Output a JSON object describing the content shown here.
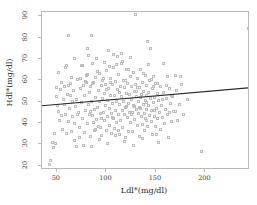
{
  "chart_data": {
    "type": "scatter",
    "title": "",
    "xlabel": "Ldl*(mg/dl)",
    "ylabel": "Hdl*(mg/dl)",
    "xlim": [
      35,
      245
    ],
    "ylim": [
      18,
      92
    ],
    "xticks": [
      50,
      100,
      150,
      200
    ],
    "xtick_labels": [
      "50",
      "100",
      "150",
      "200"
    ],
    "yticks": [
      20,
      30,
      40,
      50,
      60,
      70,
      80,
      90
    ],
    "ytick_labels": [
      "20",
      "30",
      "40",
      "50",
      "60",
      "70",
      "80",
      "90"
    ],
    "grid": false,
    "legend": null,
    "marker": "open-square",
    "marker_color": "#bdbdbd",
    "frame_color": "#b9b9b9",
    "fit_line": {
      "type": "linear-regression",
      "color": "#2a2a2a",
      "x_start": 35,
      "y_start": 47.5,
      "x_end": 245,
      "y_end": 56.0
    },
    "points": [
      [
        43,
        20.8
      ],
      [
        44,
        22.6
      ],
      [
        46,
        31.0
      ],
      [
        47,
        28.4
      ],
      [
        48,
        35.3
      ],
      [
        49,
        30.4
      ],
      [
        50,
        52.3
      ],
      [
        50,
        56.5
      ],
      [
        51,
        48.2
      ],
      [
        52,
        45.3
      ],
      [
        52,
        63.7
      ],
      [
        53,
        41.0
      ],
      [
        54,
        55.9
      ],
      [
        55,
        43.6
      ],
      [
        56,
        37.2
      ],
      [
        57,
        50.8
      ],
      [
        58,
        57.0
      ],
      [
        59,
        44.1
      ],
      [
        60,
        34.9
      ],
      [
        60,
        67.1
      ],
      [
        61,
        53.2
      ],
      [
        62,
        80.9
      ],
      [
        62,
        40.5
      ],
      [
        63,
        46.7
      ],
      [
        64,
        58.3
      ],
      [
        65,
        36.1
      ],
      [
        65,
        61.2
      ],
      [
        66,
        43.0
      ],
      [
        67,
        55.4
      ],
      [
        68,
        70.2
      ],
      [
        68,
        39.6
      ],
      [
        69,
        47.8
      ],
      [
        70,
        51.0
      ],
      [
        70,
        29.0
      ],
      [
        71,
        60.4
      ],
      [
        72,
        44.9
      ],
      [
        73,
        38.1
      ],
      [
        74,
        56.2
      ],
      [
        75,
        49.5
      ],
      [
        75,
        66.8
      ],
      [
        76,
        42.3
      ],
      [
        77,
        57.7
      ],
      [
        78,
        35.6
      ],
      [
        78,
        52.9
      ],
      [
        79,
        46.0
      ],
      [
        80,
        62.1
      ],
      [
        80,
        59.0
      ],
      [
        81,
        40.0
      ],
      [
        81,
        75.0
      ],
      [
        82,
        48.6
      ],
      [
        83,
        54.3
      ],
      [
        83,
        44.2
      ],
      [
        84,
        57.2
      ],
      [
        84,
        33.8
      ],
      [
        85,
        50.1
      ],
      [
        85,
        81.0
      ],
      [
        86,
        43.5
      ],
      [
        86,
        67.8
      ],
      [
        87,
        58.9
      ],
      [
        88,
        46.3
      ],
      [
        88,
        36.7
      ],
      [
        89,
        52.0
      ],
      [
        89,
        61.5
      ],
      [
        90,
        41.8
      ],
      [
        90,
        70.3
      ],
      [
        91,
        47.2
      ],
      [
        92,
        55.1
      ],
      [
        92,
        38.4
      ],
      [
        93,
        49.9
      ],
      [
        93,
        63.0
      ],
      [
        94,
        44.6
      ],
      [
        95,
        57.5
      ],
      [
        95,
        34.0
      ],
      [
        96,
        51.3
      ],
      [
        96,
        60.0
      ],
      [
        97,
        45.0
      ],
      [
        98,
        53.8
      ],
      [
        98,
        41.1
      ],
      [
        99,
        58.2
      ],
      [
        99,
        48.0
      ],
      [
        100,
        36.5
      ],
      [
        100,
        64.4
      ],
      [
        101,
        50.5
      ],
      [
        101,
        43.2
      ],
      [
        102,
        56.0
      ],
      [
        102,
        74.0
      ],
      [
        103,
        46.8
      ],
      [
        103,
        39.0
      ],
      [
        104,
        52.7
      ],
      [
        104,
        61.0
      ],
      [
        105,
        44.4
      ],
      [
        105,
        35.1
      ],
      [
        106,
        57.9
      ],
      [
        106,
        49.1
      ],
      [
        107,
        42.0
      ],
      [
        107,
        66.2
      ],
      [
        108,
        53.0
      ],
      [
        108,
        37.5
      ],
      [
        109,
        59.6
      ],
      [
        109,
        46.1
      ],
      [
        110,
        50.2
      ],
      [
        110,
        40.3
      ],
      [
        111,
        55.5
      ],
      [
        111,
        71.0
      ],
      [
        112,
        44.0
      ],
      [
        112,
        62.8
      ],
      [
        113,
        48.9
      ],
      [
        113,
        34.5
      ],
      [
        114,
        57.1
      ],
      [
        114,
        41.4
      ],
      [
        115,
        52.2
      ],
      [
        115,
        68.0
      ],
      [
        116,
        45.7
      ],
      [
        116,
        38.0
      ],
      [
        117,
        60.1
      ],
      [
        117,
        50.0
      ],
      [
        118,
        43.8
      ],
      [
        118,
        56.6
      ],
      [
        119,
        47.4
      ],
      [
        119,
        33.2
      ],
      [
        120,
        54.0
      ],
      [
        120,
        64.9
      ],
      [
        121,
        42.6
      ],
      [
        121,
        58.5
      ],
      [
        122,
        49.3
      ],
      [
        122,
        36.0
      ],
      [
        123,
        53.5
      ],
      [
        123,
        45.1
      ],
      [
        124,
        61.7
      ],
      [
        124,
        40.1
      ],
      [
        125,
        51.1
      ],
      [
        125,
        57.3
      ],
      [
        126,
        44.8
      ],
      [
        126,
        35.8
      ],
      [
        127,
        63.5
      ],
      [
        127,
        48.4
      ],
      [
        128,
        54.7
      ],
      [
        128,
        41.6
      ],
      [
        129,
        90.9
      ],
      [
        129,
        58.0
      ],
      [
        130,
        46.5
      ],
      [
        130,
        52.5
      ],
      [
        131,
        38.8
      ],
      [
        131,
        60.7
      ],
      [
        132,
        44.3
      ],
      [
        132,
        50.3
      ],
      [
        133,
        56.8
      ],
      [
        133,
        33.5
      ],
      [
        134,
        47.0
      ],
      [
        134,
        65.3
      ],
      [
        135,
        42.9
      ],
      [
        135,
        53.4
      ],
      [
        136,
        59.2
      ],
      [
        136,
        39.4
      ],
      [
        137,
        48.8
      ],
      [
        137,
        55.0
      ],
      [
        138,
        44.5
      ],
      [
        138,
        36.3
      ],
      [
        139,
        62.4
      ],
      [
        139,
        50.7
      ],
      [
        140,
        41.3
      ],
      [
        140,
        57.6
      ],
      [
        141,
        46.2
      ],
      [
        141,
        52.8
      ],
      [
        142,
        78.0
      ],
      [
        142,
        38.6
      ],
      [
        143,
        54.5
      ],
      [
        143,
        48.1
      ],
      [
        144,
        43.4
      ],
      [
        144,
        59.9
      ],
      [
        145,
        75.0
      ],
      [
        145,
        51.6
      ],
      [
        146,
        40.8
      ],
      [
        146,
        45.9
      ],
      [
        147,
        56.3
      ],
      [
        147,
        34.7
      ],
      [
        148,
        49.7
      ],
      [
        148,
        61.9
      ],
      [
        149,
        43.1
      ],
      [
        149,
        52.1
      ],
      [
        150,
        38.2
      ],
      [
        150,
        58.7
      ],
      [
        151,
        46.9
      ],
      [
        152,
        53.9
      ],
      [
        152,
        41.9
      ],
      [
        153,
        31.0
      ],
      [
        153,
        50.6
      ],
      [
        154,
        44.7
      ],
      [
        155,
        57.0
      ],
      [
        155,
        36.9
      ],
      [
        156,
        48.3
      ],
      [
        157,
        42.4
      ],
      [
        158,
        68.0
      ],
      [
        158,
        54.2
      ],
      [
        159,
        39.8
      ],
      [
        160,
        46.4
      ],
      [
        161,
        51.5
      ],
      [
        162,
        62.0
      ],
      [
        162,
        43.9
      ],
      [
        163,
        33.0
      ],
      [
        164,
        56.1
      ],
      [
        165,
        49.0
      ],
      [
        166,
        40.6
      ],
      [
        167,
        52.4
      ],
      [
        168,
        45.5
      ],
      [
        170,
        62.3
      ],
      [
        171,
        55.3
      ],
      [
        172,
        41.2
      ],
      [
        174,
        48.7
      ],
      [
        176,
        58.0
      ],
      [
        178,
        44.0
      ],
      [
        182,
        51.0
      ],
      [
        196,
        26.8
      ],
      [
        243,
        84.5
      ],
      [
        59,
        66.0
      ],
      [
        64,
        52.8
      ],
      [
        71,
        44.0
      ],
      [
        76,
        67.0
      ],
      [
        79,
        59.4
      ],
      [
        82,
        71.5
      ],
      [
        87,
        40.2
      ],
      [
        91,
        64.0
      ],
      [
        94,
        37.9
      ],
      [
        97,
        60.8
      ],
      [
        100,
        55.8
      ],
      [
        103,
        66.5
      ],
      [
        106,
        42.8
      ],
      [
        110,
        67.5
      ],
      [
        113,
        54.4
      ],
      [
        116,
        69.0
      ],
      [
        119,
        59.8
      ],
      [
        122,
        65.0
      ],
      [
        125,
        44.1
      ],
      [
        128,
        47.8
      ],
      [
        131,
        56.5
      ],
      [
        134,
        51.8
      ],
      [
        137,
        63.2
      ],
      [
        140,
        49.4
      ],
      [
        143,
        67.2
      ],
      [
        146,
        60.3
      ],
      [
        149,
        46.0
      ],
      [
        152,
        58.4
      ],
      [
        157,
        50.9
      ],
      [
        161,
        57.8
      ],
      [
        166,
        53.1
      ],
      [
        170,
        45.2
      ],
      [
        68,
        31.8
      ],
      [
        73,
        33.4
      ],
      [
        77,
        29.6
      ],
      [
        85,
        28.9
      ],
      [
        93,
        32.1
      ],
      [
        101,
        30.2
      ],
      [
        109,
        34.2
      ],
      [
        118,
        31.5
      ],
      [
        127,
        29.4
      ],
      [
        136,
        32.8
      ],
      [
        86,
        58.6
      ],
      [
        89,
        37.0
      ],
      [
        95,
        42.1
      ],
      [
        104,
        58.8
      ],
      [
        112,
        36.6
      ],
      [
        120,
        47.6
      ],
      [
        130,
        54.9
      ],
      [
        139,
        42.2
      ],
      [
        148,
        56.9
      ],
      [
        55,
        59.1
      ],
      [
        58,
        48.9
      ],
      [
        62,
        57.4
      ],
      [
        66,
        50.2
      ],
      [
        74,
        60.9
      ],
      [
        81,
        62.6
      ],
      [
        84,
        45.6
      ],
      [
        98,
        68.4
      ],
      [
        107,
        72.0
      ],
      [
        115,
        72.5
      ],
      [
        124,
        70.5
      ],
      [
        133,
        47.3
      ],
      [
        151,
        34.4
      ],
      [
        164,
        44.8
      ],
      [
        175,
        62.0
      ]
    ]
  }
}
